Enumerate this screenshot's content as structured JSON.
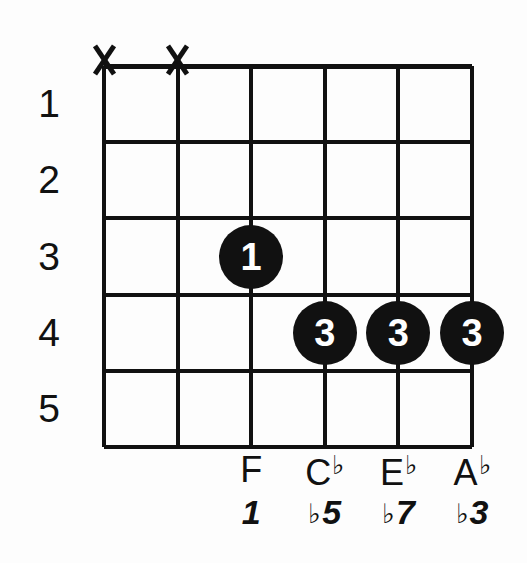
{
  "diagram": {
    "kind": "guitar-chord-diagram",
    "ink_color": "#111111",
    "background_color": "#fdfdfd",
    "string_count": 6,
    "fret_count": 5
  },
  "fret_numbers": [
    {
      "label": "1"
    },
    {
      "label": "2"
    },
    {
      "label": "3"
    },
    {
      "label": "4"
    },
    {
      "label": "5"
    }
  ],
  "mute_markers": [
    {
      "string": 1,
      "glyph": "X"
    },
    {
      "string": 2,
      "glyph": "X"
    }
  ],
  "finger_dots": [
    {
      "string": 3,
      "fret": 3,
      "finger": "1"
    },
    {
      "string": 4,
      "fret": 4,
      "finger": "3"
    },
    {
      "string": 5,
      "fret": 4,
      "finger": "3"
    },
    {
      "string": 6,
      "fret": 4,
      "finger": "3"
    }
  ],
  "note_labels": [
    {
      "string": 3,
      "letter": "F",
      "accidental": ""
    },
    {
      "string": 4,
      "letter": "C",
      "accidental": "♭"
    },
    {
      "string": 5,
      "letter": "E",
      "accidental": "♭"
    },
    {
      "string": 6,
      "letter": "A",
      "accidental": "♭"
    }
  ],
  "interval_labels": [
    {
      "string": 3,
      "accidental": "",
      "degree": "1"
    },
    {
      "string": 4,
      "accidental": "♭",
      "degree": "5"
    },
    {
      "string": 5,
      "accidental": "♭",
      "degree": "7"
    },
    {
      "string": 6,
      "accidental": "♭",
      "degree": "3"
    }
  ]
}
